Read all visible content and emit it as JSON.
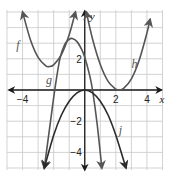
{
  "chart_data": {
    "type": "line",
    "title": "",
    "xlabel": "x",
    "ylabel": "y",
    "xlim": [
      -5,
      5
    ],
    "ylim": [
      -5,
      5
    ],
    "grid": true,
    "x_ticks": [
      {
        "value": -4,
        "label": "−4"
      },
      {
        "value": 2,
        "label": "2"
      },
      {
        "value": 4,
        "label": "4"
      }
    ],
    "y_ticks": [
      {
        "value": 2,
        "label": "2"
      },
      {
        "value": -2,
        "label": "−2"
      },
      {
        "value": -4,
        "label": "−4"
      }
    ],
    "series": [
      {
        "name": "f",
        "label": "f",
        "description": "upward parabola, vertex about (-2.3, 1.5)",
        "points": [
          [
            -4.0,
            5.0
          ],
          [
            -3.5,
            3.24
          ],
          [
            -3.0,
            2.09
          ],
          [
            -2.5,
            1.55
          ],
          [
            -2.3,
            1.5
          ],
          [
            -2.0,
            1.61
          ],
          [
            -1.5,
            2.27
          ],
          [
            -1.0,
            3.54
          ],
          [
            -0.6,
            5.0
          ]
        ],
        "color": "#555555"
      },
      {
        "name": "g",
        "label": "g",
        "description": "cubic-like curve with local max about (-0.8, 3.3)",
        "points": [
          [
            -2.6,
            -5.0
          ],
          [
            -2.2,
            -2.0
          ],
          [
            -1.9,
            0.2
          ],
          [
            -1.6,
            2.0
          ],
          [
            -1.3,
            2.9
          ],
          [
            -1.0,
            3.25
          ],
          [
            -0.8,
            3.3
          ],
          [
            -0.5,
            3.1
          ],
          [
            -0.2,
            2.6
          ],
          [
            0.0,
            2.1
          ],
          [
            0.3,
            1.0
          ],
          [
            0.5,
            0.0
          ],
          [
            0.8,
            -2.2
          ],
          [
            1.1,
            -5.0
          ]
        ],
        "color": "#555555"
      },
      {
        "name": "h",
        "label": "h",
        "description": "upward parabola, vertex about (2.2, 0)",
        "points": [
          [
            0.1,
            5.0
          ],
          [
            0.5,
            3.27
          ],
          [
            1.0,
            1.63
          ],
          [
            1.5,
            0.55
          ],
          [
            2.0,
            0.05
          ],
          [
            2.2,
            0.0
          ],
          [
            2.5,
            0.1
          ],
          [
            3.0,
            0.72
          ],
          [
            3.5,
            1.91
          ],
          [
            4.0,
            3.66
          ],
          [
            4.2,
            4.52
          ]
        ],
        "color": "#555555"
      },
      {
        "name": "j",
        "label": "j",
        "description": "downward parabola, vertex (0, 0)",
        "points": [
          [
            -2.6,
            -5.0
          ],
          [
            -2.0,
            -2.9
          ],
          [
            -1.5,
            -1.6
          ],
          [
            -1.0,
            -0.72
          ],
          [
            -0.5,
            -0.18
          ],
          [
            0.0,
            0.0
          ],
          [
            0.5,
            -0.18
          ],
          [
            1.0,
            -0.72
          ],
          [
            1.5,
            -1.6
          ],
          [
            2.0,
            -2.9
          ],
          [
            2.65,
            -5.0
          ]
        ],
        "color": "#2b2b2b"
      }
    ],
    "annotations": [
      {
        "text": "f",
        "x": -4.3,
        "y": 2.6
      },
      {
        "text": "g",
        "x": -2.3,
        "y": 0.4
      },
      {
        "text": "h",
        "x": 3.2,
        "y": 1.4
      },
      {
        "text": "j",
        "x": 2.3,
        "y": -2.8
      }
    ]
  }
}
